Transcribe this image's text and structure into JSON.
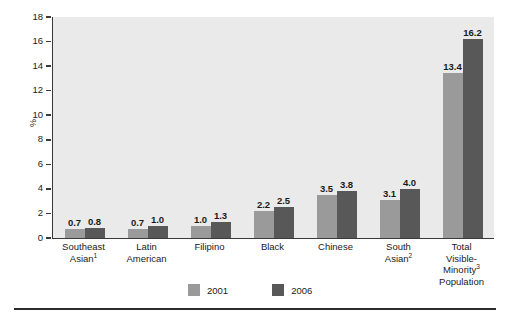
{
  "chart_data": {
    "type": "bar",
    "title": "",
    "subtitle": "",
    "xlabel": "",
    "ylabel": "%",
    "ylim": [
      0,
      18
    ],
    "yticks": [
      0,
      2,
      4,
      6,
      8,
      10,
      12,
      14,
      16,
      18
    ],
    "ytick_labels": [
      "0",
      "2",
      "4",
      "6",
      "8",
      "10",
      "12",
      "14",
      "16",
      "18"
    ],
    "grid": false,
    "legend_position": "bottom-center",
    "categories": [
      "Southeast Asian¹",
      "Latin American",
      "Filipino",
      "Black",
      "Chinese",
      "South Asian²",
      "Total Visible-Minority³ Population"
    ],
    "category_lines": [
      [
        "Southeast",
        "Asian|1"
      ],
      [
        "Latin",
        "American"
      ],
      [
        "Filipino"
      ],
      [
        "Black"
      ],
      [
        "Chinese"
      ],
      [
        "South",
        "Asian|2"
      ],
      [
        "Total",
        "Visible-",
        "Minority|3",
        "Population"
      ]
    ],
    "series": [
      {
        "name": "2001",
        "color": "#9a9a9a",
        "values": [
          0.7,
          0.7,
          1.0,
          2.2,
          3.5,
          3.1,
          13.4
        ],
        "value_labels": [
          "0.7",
          "0.7",
          "1.0",
          "2.2",
          "3.5",
          "3.1",
          "13.4"
        ]
      },
      {
        "name": "2006",
        "color": "#585858",
        "values": [
          0.8,
          1.0,
          1.3,
          2.5,
          3.8,
          4.0,
          16.2
        ],
        "value_labels": [
          "0.8",
          "1.0",
          "1.3",
          "2.5",
          "3.8",
          "4.0",
          "16.2"
        ]
      }
    ]
  },
  "legend": {
    "items": [
      {
        "label": "2001",
        "color": "#9a9a9a"
      },
      {
        "label": "2006",
        "color": "#585858"
      }
    ]
  },
  "axis": {
    "y_label": "%"
  },
  "colors": {
    "plot_background": "#eaeaea",
    "page_background": "#ffffff",
    "axis": "#3a3a3a",
    "rule": "#2b2b2b",
    "series_2001": "#9a9a9a",
    "series_2006": "#585858"
  }
}
